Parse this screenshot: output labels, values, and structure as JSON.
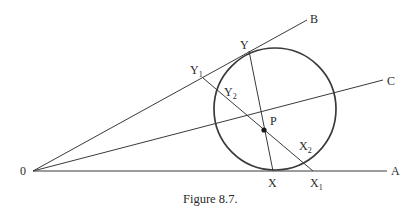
{
  "figure": {
    "caption": "Figure 8.7.",
    "colors": {
      "stroke": "#3a3a3a",
      "text": "#2a2a2a",
      "background": "#ffffff"
    },
    "points": {
      "O": {
        "label": "0",
        "x": 33,
        "y": 171
      },
      "A": {
        "label": "A",
        "x": 387,
        "y": 171
      },
      "B": {
        "label": "B",
        "x": 307,
        "y": 20
      },
      "C": {
        "label": "C",
        "x": 383,
        "y": 80
      },
      "P": {
        "label": "P",
        "x": 264,
        "y": 130
      },
      "X": {
        "label": "X",
        "x": 273,
        "y": 171
      },
      "Y": {
        "label": "Y",
        "x": 249,
        "y": 51
      },
      "X1": {
        "label": "X",
        "sub": "1",
        "x": 313,
        "y": 171
      },
      "Y1": {
        "label": "Y",
        "sub": "1",
        "x": 203,
        "y": 78
      },
      "X2": {
        "label": "X",
        "sub": "2",
        "x": 297,
        "y": 160
      },
      "Y2": {
        "label": "Y",
        "sub": "2",
        "x": 220,
        "y": 88
      }
    },
    "circle": {
      "cx": 275,
      "cy": 109,
      "r": 61
    },
    "rays": [
      "OA",
      "OB",
      "OC"
    ],
    "segments": [
      "XY",
      "X1Y1"
    ]
  }
}
